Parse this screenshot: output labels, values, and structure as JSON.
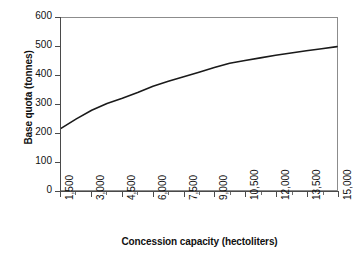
{
  "chart_data": {
    "type": "line",
    "title": "",
    "xlabel": "Concession capacity (hectoliters)",
    "ylabel": "Base quota (tonnes)",
    "xlim": [
      1500,
      15000
    ],
    "ylim": [
      0,
      600
    ],
    "grid": false,
    "legend": "none",
    "x_tick_labels": [
      "1,500",
      "3,000",
      "4,500",
      "6,000",
      "7,500",
      "9,000",
      "10,500",
      "12,000",
      "13,500",
      "15,000"
    ],
    "x_tick_values": [
      1500,
      3000,
      4500,
      6000,
      7500,
      9000,
      10500,
      12000,
      13500,
      15000
    ],
    "y_tick_labels": [
      "0",
      "100",
      "200",
      "300",
      "400",
      "500",
      "600"
    ],
    "y_tick_values": [
      0,
      100,
      200,
      300,
      400,
      500,
      600
    ],
    "series": [
      {
        "name": "Base quota",
        "color": "#1a1a1a",
        "x": [
          1500,
          2250,
          3000,
          3750,
          4500,
          5250,
          6000,
          6750,
          7500,
          8250,
          9000,
          9750,
          10500,
          11250,
          12000,
          12750,
          13500,
          14250,
          15000
        ],
        "values": [
          215,
          248,
          278,
          302,
          320,
          340,
          362,
          379,
          395,
          411,
          427,
          442,
          452,
          461,
          470,
          478,
          486,
          493,
          500
        ]
      }
    ]
  },
  "axes": {
    "y_title": "Base quota (tonnes)",
    "x_title": "Concession capacity (hectoliters)"
  },
  "colors": {
    "line": "#1a1a1a",
    "frame": "#8c8c8c",
    "spine": "#4a4a4a",
    "background": "#ffffff",
    "text": "#111111"
  }
}
